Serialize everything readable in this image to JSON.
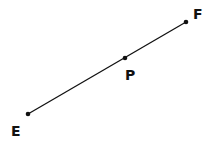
{
  "diagram": {
    "type": "line-segment",
    "points": [
      {
        "name": "E",
        "x": 28,
        "y": 114,
        "label_x": 11,
        "label_y": 136
      },
      {
        "name": "P",
        "x": 125,
        "y": 58,
        "label_x": 125,
        "label_y": 80
      },
      {
        "name": "F",
        "x": 186,
        "y": 22,
        "label_x": 193,
        "label_y": 19
      }
    ],
    "segment": {
      "from": "E",
      "to": "F"
    },
    "colors": {
      "line": "#111111",
      "point": "#111111",
      "label": "#111111",
      "background": "#ffffff"
    }
  }
}
